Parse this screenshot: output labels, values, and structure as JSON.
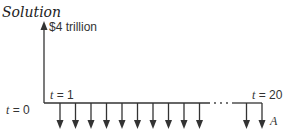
{
  "title": "Solution",
  "diagram": {
    "type": "cash-flow-diagram",
    "inflow_label": "$4 trillion",
    "t_start_label_var": "t",
    "t_start_label_value": "= 0",
    "t_first_label_var": "t",
    "t_first_label_value": "= 1",
    "t_end_label_var": "t",
    "t_end_label_value": "= 20",
    "payment_label": "A",
    "ellipsis": "···",
    "num_payment_arrows_drawn": 12,
    "colors": {
      "line": "#333333",
      "text": "#333333"
    }
  }
}
